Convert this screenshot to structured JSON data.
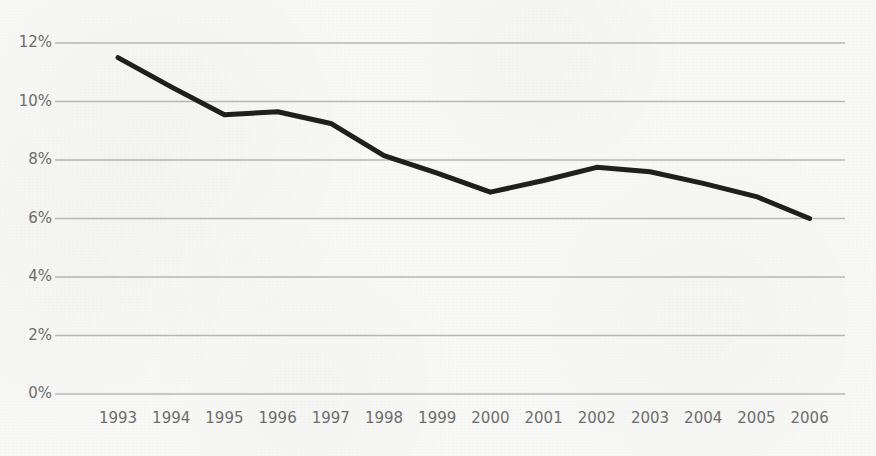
{
  "chart_data": {
    "type": "line",
    "title": "",
    "subtitle": "",
    "xlabel": "",
    "ylabel": "",
    "categories": [
      "1993",
      "1994",
      "1995",
      "1996",
      "1997",
      "1998",
      "1999",
      "2000",
      "2001",
      "2002",
      "2003",
      "2004",
      "2005",
      "2006"
    ],
    "values": [
      11.5,
      10.5,
      9.55,
      9.65,
      9.25,
      8.15,
      7.55,
      6.9,
      7.3,
      7.75,
      7.6,
      7.2,
      6.75,
      6.0
    ],
    "series": [
      {
        "name": "",
        "values": [
          11.5,
          10.5,
          9.55,
          9.65,
          9.25,
          8.15,
          7.55,
          6.9,
          7.3,
          7.75,
          7.6,
          7.2,
          6.75,
          6.0
        ]
      }
    ],
    "ylim": [
      0,
      12
    ],
    "ytick_values": [
      0,
      2,
      4,
      6,
      8,
      10,
      12
    ],
    "ytick_labels": [
      "0%",
      "2%",
      "4%",
      "6%",
      "8%",
      "10%",
      "12%"
    ],
    "xtick_labels": [
      "1993",
      "1994",
      "1995",
      "1996",
      "1997",
      "1998",
      "1999",
      "2000",
      "2001",
      "2002",
      "2003",
      "2004",
      "2005",
      "2006"
    ],
    "grid": true,
    "grid_axis": "y",
    "legend": false,
    "legend_position": "none",
    "annotations": [],
    "value_format": "percent"
  },
  "style": {
    "line_color": "#1f1f1f",
    "grid_color": "#b9b9b9",
    "tick_label_color": "#6f6f6f",
    "background_color": "#f8f8f6",
    "line_width": 5
  },
  "geometry": {
    "plot_left": 55,
    "plot_right": 845,
    "plot_top": 43,
    "plot_bottom": 394,
    "first_point_x": 118,
    "point_spacing": 53.2
  }
}
